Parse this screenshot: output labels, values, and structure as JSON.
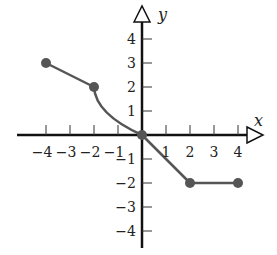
{
  "chart_data": {
    "type": "line",
    "title": "",
    "xlabel": "x",
    "ylabel": "y",
    "xlim": [
      -5,
      5
    ],
    "ylim": [
      -5,
      5
    ],
    "x_ticks": [
      -4,
      -3,
      -2,
      -1,
      1,
      2,
      3,
      4
    ],
    "y_ticks": [
      4,
      3,
      2,
      1,
      -1,
      -2,
      -3,
      -4
    ],
    "x_tick_labels": [
      "−4",
      "−3",
      "−2",
      "−1",
      "1",
      "2",
      "3",
      "4"
    ],
    "y_tick_labels": [
      "4",
      "3",
      "2",
      "1",
      "−1",
      "−2",
      "−3",
      "−4"
    ],
    "grid": false,
    "segments": [
      {
        "kind": "line",
        "points": [
          [
            -4,
            3
          ],
          [
            -2,
            2
          ]
        ]
      },
      {
        "kind": "curve",
        "points": [
          [
            -2,
            2
          ],
          [
            -1.5,
            1.0
          ],
          [
            -1,
            0.55
          ],
          [
            -0.5,
            0.22
          ],
          [
            0,
            0
          ]
        ]
      },
      {
        "kind": "line",
        "points": [
          [
            0,
            0
          ],
          [
            2,
            -2
          ]
        ]
      },
      {
        "kind": "line",
        "points": [
          [
            2,
            -2
          ],
          [
            4,
            -2
          ]
        ]
      }
    ],
    "endpoints": [
      [
        -4,
        3
      ],
      [
        -2,
        2
      ],
      [
        0,
        0
      ],
      [
        2,
        -2
      ],
      [
        4,
        -2
      ]
    ],
    "colors": {
      "curve": "#555555",
      "axis": "#111111",
      "point": "#555555"
    }
  }
}
